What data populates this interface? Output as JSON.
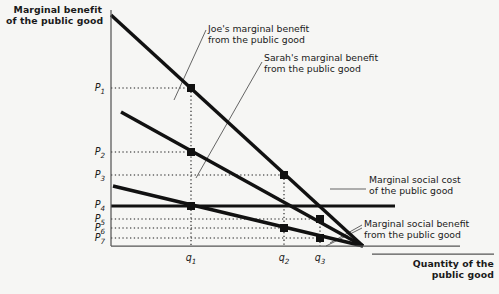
{
  "axes": {
    "y_title": "Marginal benefit\nof the public good",
    "x_title": "Quantity of the\npublic good",
    "y_ticks": [
      {
        "name": "P1",
        "label_main": "P",
        "label_sub": "1",
        "y": 88
      },
      {
        "name": "P2",
        "label_main": "P",
        "label_sub": "2",
        "y": 152
      },
      {
        "name": "P3",
        "label_main": "P",
        "label_sub": "3",
        "y": 175
      },
      {
        "name": "P4",
        "label_main": "P",
        "label_sub": "4",
        "y": 205
      },
      {
        "name": "P5",
        "label_main": "P",
        "label_sub": "5",
        "y": 219
      },
      {
        "name": "P6",
        "label_main": "P",
        "label_sub": "6",
        "y": 228
      },
      {
        "name": "P7",
        "label_main": "P",
        "label_sub": "7",
        "y": 238
      }
    ],
    "x_ticks": [
      {
        "name": "q1",
        "label_main": "q",
        "label_sub": "1",
        "x": 191
      },
      {
        "name": "q2",
        "label_main": "q",
        "label_sub": "2",
        "x": 284
      },
      {
        "name": "q3",
        "label_main": "q",
        "label_sub": "3",
        "x": 320
      }
    ],
    "origin": {
      "x": 111,
      "y": 246
    },
    "x_end": 460,
    "y_top": 10
  },
  "annotations": {
    "joe": "Joe's marginal benefit\nfrom the public good",
    "sarah": "Sarah's marginal benefit\nfrom the public good",
    "msc": "Marginal social cost\nof the public good",
    "msb": "Marginal social benefit\nfrom the public good"
  },
  "colors": {
    "background": "#f6f6f4",
    "ink": "#111111",
    "axis": "#444444",
    "dotted": "#1a1a1a"
  },
  "chart_data": {
    "type": "line",
    "title": "",
    "xlabel": "Quantity of the public good",
    "ylabel": "Marginal benefit of the public good",
    "grid": false,
    "legend": "inline-annotations",
    "series": [
      {
        "name": "Joe's marginal benefit from the public good",
        "points": [
          [
            111,
            15
          ],
          [
            363,
            246
          ]
        ],
        "style": "thick-downward-sloping"
      },
      {
        "name": "Sarah's marginal benefit from the public good",
        "points": [
          [
            121,
            112
          ],
          [
            363,
            246
          ]
        ],
        "style": "thick-downward-sloping"
      },
      {
        "name": "Marginal social benefit from the public good",
        "points": [
          [
            113,
            186
          ],
          [
            363,
            246
          ]
        ],
        "style": "thick-downward-sloping"
      },
      {
        "name": "Marginal social cost of the public good",
        "points": [
          [
            111,
            206
          ],
          [
            395,
            206
          ]
        ],
        "style": "thick-horizontal"
      }
    ],
    "markers": [
      {
        "name": "joe-at-q1",
        "x": 191,
        "y": 88,
        "price": "P1",
        "quantity": "q1"
      },
      {
        "name": "sarah-at-q1",
        "x": 191,
        "y": 152,
        "price": "P2",
        "quantity": "q1"
      },
      {
        "name": "joe-at-q2",
        "x": 284,
        "y": 175,
        "price": "P3",
        "quantity": "q2"
      },
      {
        "name": "msb-at-q1",
        "x": 191,
        "y": 206,
        "price": "P4",
        "quantity": "q1"
      },
      {
        "name": "sarah-at-q3",
        "x": 320,
        "y": 219,
        "price": "P5",
        "quantity": "q3"
      },
      {
        "name": "msb-at-q2",
        "x": 284,
        "y": 228,
        "price": "P6",
        "quantity": "q2"
      },
      {
        "name": "msb-at-q3",
        "x": 320,
        "y": 238,
        "price": "P7",
        "quantity": "q3"
      }
    ]
  }
}
